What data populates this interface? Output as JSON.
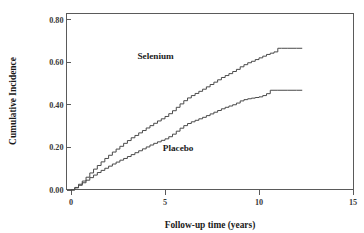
{
  "chart_data": {
    "type": "line",
    "title": "",
    "xlabel": "Follow-up time (years)",
    "ylabel": "Cumulative Incidence",
    "xlim": [
      0,
      15
    ],
    "ylim": [
      0.0,
      0.8
    ],
    "xticks": [
      "0",
      "5",
      "10",
      "15"
    ],
    "xtick_values": [
      0,
      5,
      10,
      15
    ],
    "yticks": [
      "0.00",
      "0.20",
      "0.40",
      "0.60",
      "0.80"
    ],
    "ytick_values": [
      0.0,
      0.2,
      0.4,
      0.6,
      0.8
    ],
    "grid": false,
    "legend_position": "inline-annotations",
    "line_color": "#4a4a4a",
    "frame_color": "#5a5a5a",
    "annotations": [
      {
        "text": "Selenium",
        "x": 4.5,
        "y": 0.615
      },
      {
        "text": "Placebo",
        "x": 5.7,
        "y": 0.182
      }
    ],
    "series": [
      {
        "name": "Selenium",
        "step": true,
        "final_value": 0.665,
        "x": [
          0.0,
          0.2,
          0.4,
          0.6,
          0.8,
          1.0,
          1.2,
          1.4,
          1.6,
          1.8,
          2.0,
          2.2,
          2.4,
          2.6,
          2.8,
          3.0,
          3.2,
          3.4,
          3.6,
          3.8,
          4.0,
          4.2,
          4.4,
          4.6,
          4.8,
          5.0,
          5.2,
          5.4,
          5.6,
          5.8,
          6.0,
          6.2,
          6.4,
          6.6,
          6.8,
          7.0,
          7.2,
          7.4,
          7.6,
          7.8,
          8.0,
          8.2,
          8.4,
          8.6,
          8.8,
          9.0,
          9.2,
          9.4,
          9.6,
          9.8,
          10.0,
          10.2,
          10.4,
          10.6,
          10.8,
          11.0,
          11.2,
          11.5,
          12.0,
          12.3
        ],
        "y": [
          0.0,
          0.012,
          0.027,
          0.042,
          0.06,
          0.08,
          0.098,
          0.115,
          0.132,
          0.148,
          0.163,
          0.178,
          0.192,
          0.205,
          0.219,
          0.232,
          0.245,
          0.256,
          0.268,
          0.279,
          0.291,
          0.302,
          0.313,
          0.324,
          0.334,
          0.345,
          0.358,
          0.372,
          0.388,
          0.404,
          0.419,
          0.432,
          0.443,
          0.453,
          0.463,
          0.473,
          0.484,
          0.495,
          0.506,
          0.517,
          0.528,
          0.537,
          0.546,
          0.556,
          0.566,
          0.578,
          0.588,
          0.597,
          0.604,
          0.612,
          0.62,
          0.628,
          0.636,
          0.642,
          0.648,
          0.665,
          0.665,
          0.665,
          0.665,
          0.665
        ]
      },
      {
        "name": "Placebo",
        "step": true,
        "final_value": 0.468,
        "x": [
          0.0,
          0.2,
          0.4,
          0.6,
          0.8,
          1.0,
          1.2,
          1.4,
          1.6,
          1.8,
          2.0,
          2.2,
          2.4,
          2.6,
          2.8,
          3.0,
          3.2,
          3.4,
          3.6,
          3.8,
          4.0,
          4.2,
          4.4,
          4.6,
          4.8,
          5.0,
          5.2,
          5.4,
          5.6,
          5.8,
          6.0,
          6.2,
          6.4,
          6.6,
          6.8,
          7.0,
          7.2,
          7.4,
          7.6,
          7.8,
          8.0,
          8.2,
          8.4,
          8.6,
          8.8,
          9.0,
          9.2,
          9.4,
          9.6,
          9.8,
          10.0,
          10.2,
          10.4,
          10.6,
          11.0,
          11.5,
          12.0,
          12.3
        ],
        "y": [
          0.0,
          0.01,
          0.022,
          0.034,
          0.046,
          0.058,
          0.07,
          0.082,
          0.092,
          0.102,
          0.112,
          0.122,
          0.131,
          0.14,
          0.148,
          0.157,
          0.166,
          0.175,
          0.184,
          0.193,
          0.202,
          0.211,
          0.219,
          0.226,
          0.233,
          0.24,
          0.25,
          0.262,
          0.276,
          0.29,
          0.302,
          0.312,
          0.32,
          0.327,
          0.334,
          0.341,
          0.349,
          0.357,
          0.365,
          0.373,
          0.381,
          0.388,
          0.394,
          0.4,
          0.408,
          0.418,
          0.424,
          0.428,
          0.431,
          0.434,
          0.437,
          0.443,
          0.452,
          0.468,
          0.468,
          0.468,
          0.468,
          0.468
        ]
      }
    ]
  },
  "axes": {
    "y_title": "Cumulative Incidence",
    "x_title": "Follow-up time (years)"
  }
}
